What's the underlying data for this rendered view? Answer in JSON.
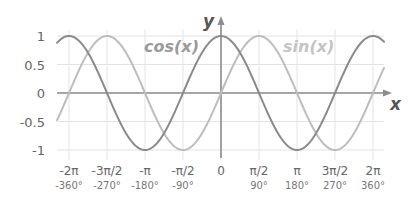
{
  "chart_data": {
    "type": "line",
    "title": "",
    "xlabel": "x",
    "ylabel": "y",
    "xlim": [
      -6.9,
      6.9
    ],
    "ylim": [
      -1,
      1
    ],
    "grid": true,
    "legend": "inline labels",
    "x_ticks": [
      {
        "rad": "-2π",
        "deg": "-360°",
        "value": -6.2832
      },
      {
        "rad": "-3π/2",
        "deg": "-270°",
        "value": -4.7124
      },
      {
        "rad": "-π",
        "deg": "-180°",
        "value": -3.1416
      },
      {
        "rad": "-π/2",
        "deg": "-90°",
        "value": -1.5708
      },
      {
        "rad": "0",
        "deg": "",
        "value": 0
      },
      {
        "rad": "π/2",
        "deg": "90°",
        "value": 1.5708
      },
      {
        "rad": "π",
        "deg": "180°",
        "value": 3.1416
      },
      {
        "rad": "3π/2",
        "deg": "270°",
        "value": 4.7124
      },
      {
        "rad": "2π",
        "deg": "360°",
        "value": 6.2832
      }
    ],
    "y_ticks": [
      {
        "label": "1",
        "value": 1
      },
      {
        "label": "0.5",
        "value": 0.5
      },
      {
        "label": "0",
        "value": 0
      },
      {
        "label": "-0.5",
        "value": -0.5
      },
      {
        "label": "-1",
        "value": -1
      }
    ],
    "series": [
      {
        "name": "cos(x)",
        "function": "cos",
        "color": "#8a8a8a",
        "x": [
          -6.2832,
          -4.7124,
          -3.1416,
          -1.5708,
          0,
          1.5708,
          3.1416,
          4.7124,
          6.2832
        ],
        "values": [
          1,
          0,
          -1,
          0,
          1,
          0,
          -1,
          0,
          1
        ]
      },
      {
        "name": "sin(x)",
        "function": "sin",
        "color": "#bdbdbd",
        "x": [
          -6.2832,
          -4.7124,
          -3.1416,
          -1.5708,
          0,
          1.5708,
          3.1416,
          4.7124,
          6.2832
        ],
        "values": [
          0,
          1,
          0,
          -1,
          0,
          1,
          0,
          -1,
          0
        ]
      }
    ],
    "annotations": [
      {
        "text": "cos(x)",
        "color": "#999999"
      },
      {
        "text": "sin(x)",
        "color": "#c4c4c4"
      }
    ]
  },
  "labels": {
    "x_axis": "x",
    "y_axis": "y",
    "cos_label": "cos(x)",
    "sin_label": "sin(x)"
  }
}
